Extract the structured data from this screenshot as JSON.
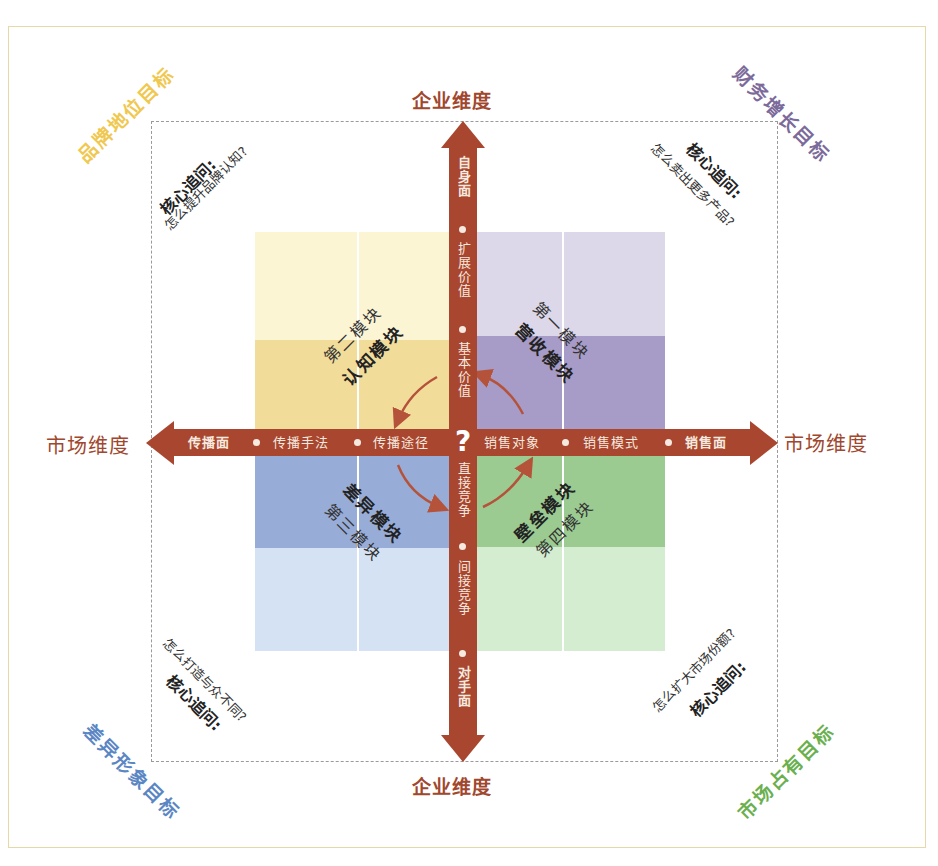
{
  "colors": {
    "axis": "#a84630",
    "axis_text": "#f6e9df",
    "axis_label": "#a0472e",
    "frame_border": "#e6d9a8",
    "dash_border": "#9a9a9a",
    "q1_dark": "#a79bc7",
    "q1_light": "#dcd8ea",
    "q2_dark": "#f2dc9a",
    "q2_light": "#fbf5d4",
    "q3_dark": "#98acd8",
    "q3_light": "#d5e2f3",
    "q4_dark": "#9ccb92",
    "q4_light": "#d4ecd0",
    "goal_tl": "#f0c850",
    "goal_tr": "#7b6a9a",
    "goal_bl": "#5b86c4",
    "goal_br": "#6bb04f"
  },
  "axes": {
    "top_label": "企业维度",
    "bottom_label": "企业维度",
    "left_label": "市场维度",
    "right_label": "市场维度",
    "center_symbol": "?",
    "vertical_up": [
      "自身面",
      "扩展价值",
      "基本价值"
    ],
    "vertical_down": [
      "直接竞争",
      "间接竞争",
      "对手面"
    ],
    "horizontal_left": [
      "传播面",
      "传播手法",
      "传播途径"
    ],
    "horizontal_right": [
      "销售对象",
      "销售模式",
      "销售面"
    ]
  },
  "corners": {
    "top_left": {
      "goal": "品牌地位目标",
      "question_title": "核心追问:",
      "question": "怎么提升品牌认知?"
    },
    "top_right": {
      "goal": "财务增长目标",
      "question_title": "核心追问:",
      "question": "怎么卖出更多产品?"
    },
    "bottom_left": {
      "goal": "差异形象目标",
      "question_title": "核心追问:",
      "question": "怎么打造与众不同?"
    },
    "bottom_right": {
      "goal": "市场占有目标",
      "question_title": "核心追问:",
      "question": "怎么扩大市场份额?"
    }
  },
  "modules": {
    "q1": {
      "number": "第一模块",
      "name": "营收模块"
    },
    "q2": {
      "number": "第二模块",
      "name": "认知模块"
    },
    "q3": {
      "number": "第三模块",
      "name": "差异模块"
    },
    "q4": {
      "number": "第四模块",
      "name": "壁垒模块"
    }
  }
}
